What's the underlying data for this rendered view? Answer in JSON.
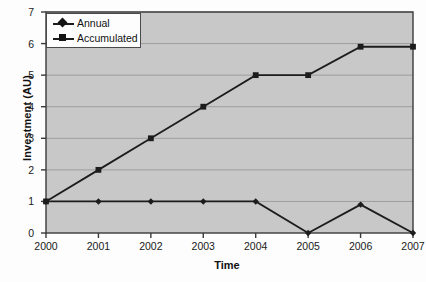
{
  "chart_data": {
    "type": "line",
    "title": "",
    "xlabel": "Time",
    "ylabel": "Investment (AU)",
    "categories": [
      "2000",
      "2001",
      "2002",
      "2003",
      "2004",
      "2005",
      "2006",
      "2007"
    ],
    "x": [
      2000,
      2001,
      2002,
      2003,
      2004,
      2005,
      2006,
      2007
    ],
    "xlim": [
      2000,
      2007
    ],
    "ylim": [
      0,
      7
    ],
    "yticks": [
      "0",
      "1",
      "2",
      "3",
      "4",
      "5",
      "6",
      "7"
    ],
    "ytick_values": [
      0,
      1,
      2,
      3,
      4,
      5,
      6,
      7
    ],
    "grid": "horizontal",
    "legend_position": "top-left-inside",
    "series": [
      {
        "name": "Annual",
        "marker": "diamond",
        "values": [
          1,
          1,
          1,
          1,
          1,
          0,
          0.9,
          0
        ]
      },
      {
        "name": "Accumulated",
        "marker": "square",
        "values": [
          1,
          2,
          3,
          4,
          5,
          5,
          5.9,
          5.9
        ]
      }
    ],
    "colors": {
      "line": "#1c1c1c",
      "plot_background": "#c8c8c8",
      "grid": "#9d9d9d",
      "axis": "#3a3a3a",
      "figure_background": "#fdfdfd"
    }
  }
}
